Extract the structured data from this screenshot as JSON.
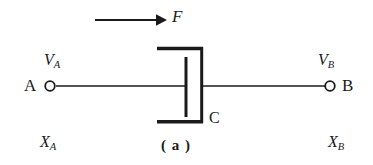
{
  "figure": {
    "caption": "( a )",
    "background_color": "#ffffff",
    "stroke_color": "#1a1a1a",
    "width": 373,
    "height": 165
  },
  "force": {
    "symbol": "F",
    "arrow_name": "force-arrow",
    "direction": "right",
    "arrow_start_x": 95,
    "arrow_end_x": 166,
    "arrow_y": 20
  },
  "terminals": [
    {
      "id": "A",
      "node_label": "A",
      "voltage_symbol": "V",
      "voltage_subscript": "A",
      "position_symbol": "X",
      "position_subscript": "A",
      "circle_x": 50,
      "circle_y": 86,
      "circle_r": 5
    },
    {
      "id": "B",
      "node_label": "B",
      "voltage_symbol": "V",
      "voltage_subscript": "B",
      "position_symbol": "X",
      "position_subscript": "B",
      "circle_x": 330,
      "circle_y": 86,
      "circle_r": 5
    }
  ],
  "capacitor": {
    "label": "C",
    "moving_plate_name": "capacitor-moving-plate",
    "fixed_plate_name": "capacitor-fixed-plate",
    "bracket_left_x": 157,
    "bracket_right_x": 202,
    "bracket_top_y": 48,
    "bracket_bottom_y": 122,
    "inner_plate_x": 186,
    "inner_plate_top_y": 57,
    "inner_plate_bottom_y": 117
  },
  "wires": {
    "left_wire_name": "wire-a-to-plate",
    "left_wire_x1": 56,
    "left_wire_x2": 186,
    "right_wire_name": "wire-plate-to-b",
    "right_wire_x1": 202,
    "right_wire_x2": 325,
    "wire_y": 86
  }
}
